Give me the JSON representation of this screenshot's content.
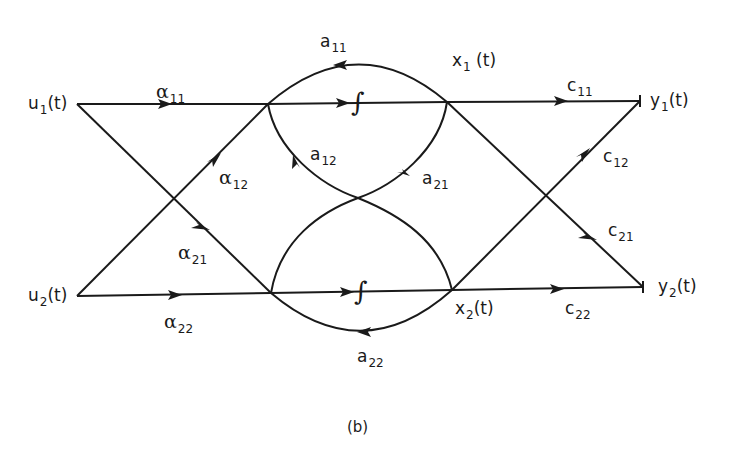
{
  "figure": {
    "caption": "(b)",
    "colors": {
      "ink": "#1a1a1a",
      "background": "#ffffff"
    }
  },
  "nodes": {
    "u1": {
      "base": "u",
      "sub": "1",
      "arg": "(t)"
    },
    "u2": {
      "base": "u",
      "sub": "2",
      "arg": "(t)"
    },
    "x1": {
      "base": "x",
      "sub": "1",
      "arg": "(t)"
    },
    "x2": {
      "base": "x",
      "sub": "2",
      "arg": "(t)"
    },
    "y1": {
      "base": "y",
      "sub": "1",
      "arg": "(t)"
    },
    "y2": {
      "base": "y",
      "sub": "2",
      "arg": "(t)"
    }
  },
  "integrators": {
    "top": {
      "symbol": "∫"
    },
    "bottom": {
      "symbol": "∫"
    }
  },
  "edges": {
    "alpha11": {
      "base": "α",
      "sub": "11",
      "from": "u1",
      "to": "integrator-top"
    },
    "alpha12": {
      "base": "α",
      "sub": "12",
      "from": "u2",
      "to": "integrator-top"
    },
    "alpha21": {
      "base": "α",
      "sub": "21",
      "from": "u1",
      "to": "integrator-bottom"
    },
    "alpha22": {
      "base": "α",
      "sub": "22",
      "from": "u2",
      "to": "integrator-bottom"
    },
    "a11": {
      "base": "a",
      "sub": "11",
      "from": "x1",
      "to": "integrator-top"
    },
    "a12": {
      "base": "a",
      "sub": "12",
      "from": "x2",
      "to": "integrator-top"
    },
    "a21": {
      "base": "a",
      "sub": "21",
      "from": "x1",
      "to": "integrator-bottom"
    },
    "a22": {
      "base": "a",
      "sub": "22",
      "from": "x2",
      "to": "integrator-bottom"
    },
    "c11": {
      "base": "c",
      "sub": "11",
      "from": "x1",
      "to": "y1"
    },
    "c12": {
      "base": "c",
      "sub": "12",
      "from": "x2",
      "to": "y1"
    },
    "c21": {
      "base": "c",
      "sub": "21",
      "from": "x1",
      "to": "y2"
    },
    "c22": {
      "base": "c",
      "sub": "22",
      "from": "x2",
      "to": "y2"
    }
  }
}
